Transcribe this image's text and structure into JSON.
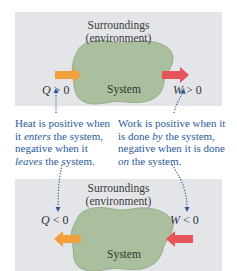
{
  "colors": {
    "panel_bg": "#e3e5e9",
    "system_fill": "#a9bf9e",
    "system_stroke": "#8ea383",
    "heat_arrow": "#f0a03c",
    "work_arrow": "#e8545a",
    "caption_text": "#2a5a9a",
    "dotted_arrow": "#2a5a9a"
  },
  "top_panel": {
    "surroundings_line1": "Surroundings",
    "surroundings_line2": "(environment)",
    "system_label": "System",
    "heat_sign": {
      "symbol": "Q",
      "relation": " > 0"
    },
    "work_sign": {
      "symbol": "W",
      "relation": " > 0"
    },
    "heat_arrow_direction": "into system",
    "work_arrow_direction": "out of system"
  },
  "captions": {
    "heat": {
      "line1": "Heat is positive when",
      "line2_pre": "it ",
      "line2_em": "enters",
      "line2_post": " the system,",
      "line3": "negative when it",
      "line4_em": "leaves",
      "line4_post": " the system."
    },
    "work": {
      "line1": "Work is positive when it",
      "line2_pre": "is done ",
      "line2_em": "by",
      "line2_post": " the system,",
      "line3": "negative when it is done",
      "line4_em": "on",
      "line4_post": " the system."
    }
  },
  "bottom_panel": {
    "surroundings_line1": "Surroundings",
    "surroundings_line2": "(environment)",
    "system_label": "System",
    "heat_sign": {
      "symbol": "Q",
      "relation": " < 0"
    },
    "work_sign": {
      "symbol": "W",
      "relation": " < 0"
    },
    "heat_arrow_direction": "out of system",
    "work_arrow_direction": "into system"
  }
}
